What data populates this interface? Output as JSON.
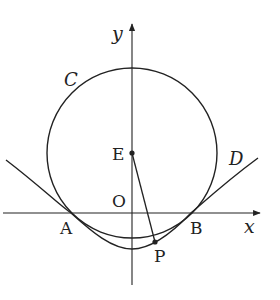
{
  "diagram": {
    "type": "coordinate-geometry",
    "axes": {
      "x_label": "x",
      "y_label": "y",
      "origin_label": "O"
    },
    "curves": [
      {
        "id": "C",
        "label": "C",
        "kind": "circle",
        "center": "E"
      },
      {
        "id": "D",
        "label": "D",
        "kind": "curve through A and B"
      }
    ],
    "points": [
      {
        "id": "E",
        "label": "E",
        "note": "center of circle C on y-axis"
      },
      {
        "id": "A",
        "label": "A",
        "note": "intersection on negative x-axis"
      },
      {
        "id": "B",
        "label": "B",
        "note": "intersection on positive x-axis"
      },
      {
        "id": "P",
        "label": "P",
        "note": "point on curve D"
      },
      {
        "id": "O",
        "label": "O",
        "note": "origin"
      }
    ],
    "segments": [
      {
        "from": "E",
        "to": "P"
      }
    ],
    "colors": {
      "stroke": "#222222",
      "background": "#ffffff"
    }
  }
}
